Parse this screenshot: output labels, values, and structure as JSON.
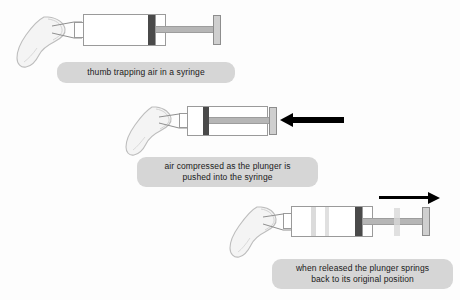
{
  "figure": {
    "background_color": "#fdfdfd",
    "caption_background_color": "#d6d6d6",
    "caption_text_color": "#1a1a1a",
    "seal_color": "#4a4a4a",
    "rod_color": "#b6b6b6",
    "flange_color": "#cfcfcf",
    "outline_color": "#9a9a9a",
    "arrow_color": "#000000",
    "thumb_fill_color": "#f2f2f2",
    "thumb_outline_color": "#b8b8b8"
  },
  "panels": [
    {
      "id": "panel-1",
      "caption_lines": [
        "thumb trapping air in a syringe"
      ],
      "thumb_label": "thumb",
      "syringe_label": "syringe",
      "plunger_state": "extended",
      "arrow": null
    },
    {
      "id": "panel-2",
      "caption_lines": [
        "air compressed as the plunger is",
        "pushed into the syringe"
      ],
      "thumb_label": "thumb",
      "syringe_label": "syringe",
      "plunger_state": "compressed",
      "arrow": {
        "direction": "left",
        "label": "push-arrow"
      }
    },
    {
      "id": "panel-3",
      "caption_lines": [
        "when released the plunger springs",
        "back to its original position"
      ],
      "thumb_label": "thumb",
      "syringe_label": "syringe",
      "plunger_state": "springing-back",
      "arrow": {
        "direction": "right",
        "label": "release-arrow"
      }
    }
  ]
}
